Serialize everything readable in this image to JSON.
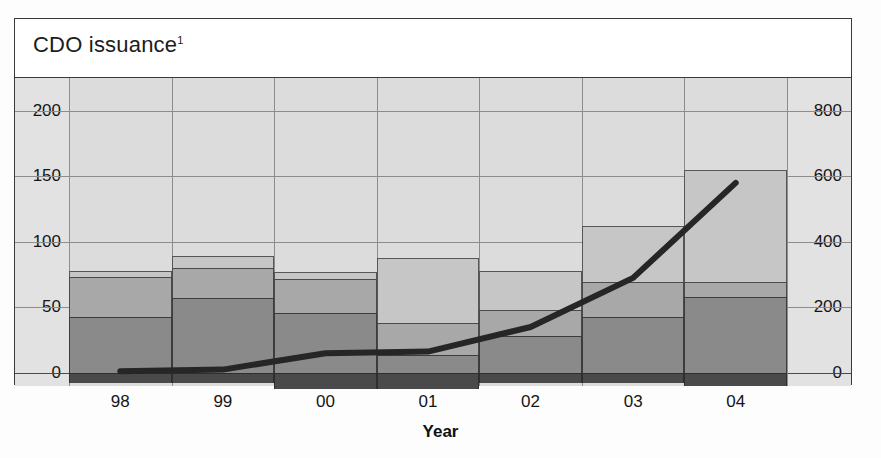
{
  "figure": {
    "title": "CDO issuance",
    "title_superscript": "1",
    "xaxis_title": "Year"
  },
  "colors": {
    "segment_bottom": "#4a4a4a",
    "segment_dark": "#8a8a8a",
    "segment_mid": "#a8a8a8",
    "segment_light": "#c6c6c6",
    "line": "#262626",
    "plot_background": "#dcdcdc",
    "gutter_background": "#e2e2e2",
    "gridline": "#8d8d8d",
    "frame": "#3a3a3a"
  },
  "axes": {
    "left": {
      "ticks": [
        "0",
        "50",
        "100",
        "150",
        "200"
      ],
      "values": [
        0,
        50,
        100,
        150,
        200
      ],
      "min": -10,
      "max": 225
    },
    "right": {
      "ticks": [
        "0",
        "200",
        "400",
        "600",
        "800"
      ],
      "values": [
        0,
        200,
        400,
        600,
        800
      ],
      "min": -40,
      "max": 900
    },
    "x": {
      "ticks": [
        "98",
        "99",
        "00",
        "01",
        "02",
        "03",
        "04"
      ]
    }
  },
  "chart_data": {
    "type": "bar",
    "title": "CDO issuance",
    "xlabel": "Year",
    "ylabel": "",
    "categories": [
      "98",
      "99",
      "00",
      "01",
      "02",
      "03",
      "04"
    ],
    "ylim": [
      -10,
      225
    ],
    "y2lim": [
      -40,
      900
    ],
    "grid": true,
    "legend": "none",
    "stacked": true,
    "series": [
      {
        "name": "segment-bottom",
        "axis": "left",
        "values": [
          -8,
          -8,
          -12,
          -12,
          -8,
          -8,
          -10
        ]
      },
      {
        "name": "segment-dark",
        "axis": "left",
        "values": [
          43,
          57,
          46,
          14,
          28,
          43,
          58
        ]
      },
      {
        "name": "segment-mid",
        "axis": "left",
        "values": [
          30,
          23,
          26,
          24,
          20,
          26,
          11
        ]
      },
      {
        "name": "segment-light",
        "axis": "left",
        "values": [
          5,
          9,
          5,
          50,
          30,
          43,
          86
        ]
      }
    ],
    "stack_totals": [
      78,
      89,
      77,
      88,
      78,
      112,
      155
    ],
    "overlay_line": {
      "name": "line-series",
      "axis": "right",
      "type": "line",
      "x": [
        "98",
        "99",
        "00",
        "01",
        "02",
        "03",
        "04"
      ],
      "values": [
        5,
        10,
        60,
        65,
        140,
        290,
        580
      ]
    }
  }
}
